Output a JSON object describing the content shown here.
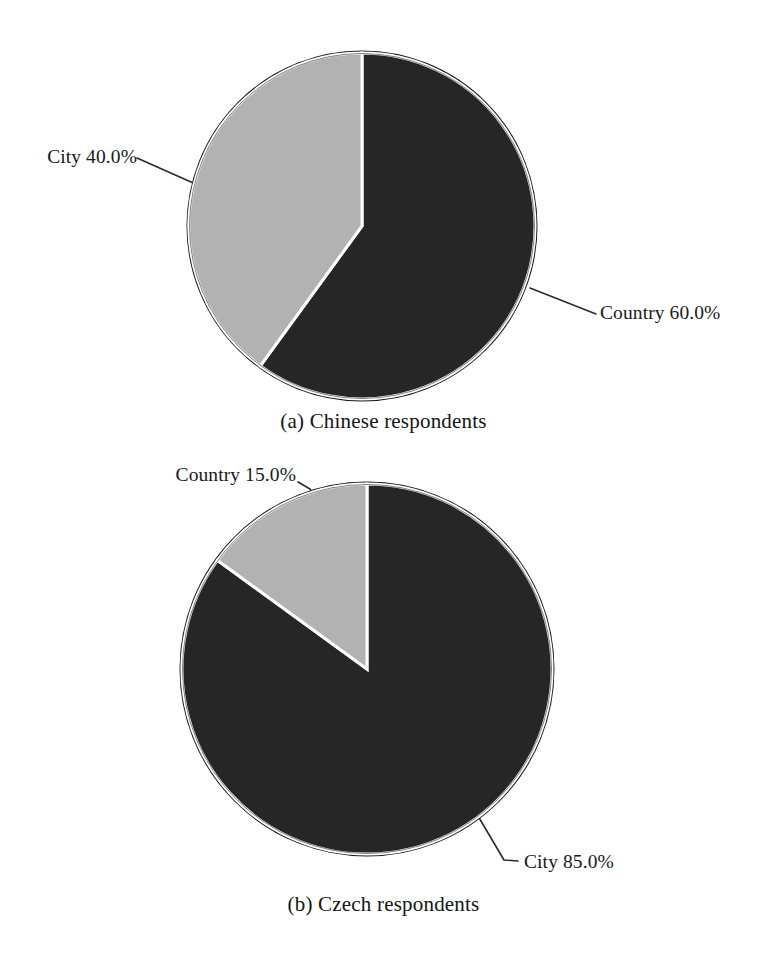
{
  "figure": {
    "background": "#ffffff",
    "slice_colors": {
      "dark": "#262626",
      "light": "#b2b2b2",
      "divider": "#ffffff",
      "outline": "#1a1a1a"
    },
    "leader_color": "#2b2b2b"
  },
  "chart_data": [
    {
      "type": "pie",
      "id": "chinese-respondents",
      "title": "(a) Chinese respondents",
      "caption": "(a) Chinese respondents",
      "categories": [
        "Country",
        "City"
      ],
      "values": [
        60.0,
        40.0
      ],
      "labels": [
        "Country 60.0%",
        "City 40.0%"
      ],
      "colors": [
        "#262626",
        "#b2b2b2"
      ],
      "start_angle_deg": 0,
      "direction": "clockwise",
      "units": "percent",
      "legend": "none",
      "grid": false
    },
    {
      "type": "pie",
      "id": "czech-respondents",
      "title": "(b) Czech respondents",
      "caption": "(b) Czech respondents",
      "categories": [
        "City",
        "Country"
      ],
      "values": [
        85.0,
        15.0
      ],
      "labels": [
        "City 85.0%",
        "Country 15.0%"
      ],
      "colors": [
        "#262626",
        "#b2b2b2"
      ],
      "start_angle_deg": 0,
      "direction": "clockwise",
      "units": "percent",
      "legend": "none",
      "grid": false
    }
  ],
  "panel_a": {
    "caption": "(a) Chinese respondents",
    "label_city": "City 40.0%",
    "label_country": "Country 60.0%"
  },
  "panel_b": {
    "caption": "(b) Czech respondents",
    "label_country": "Country 15.0%",
    "label_city": "City 85.0%"
  }
}
